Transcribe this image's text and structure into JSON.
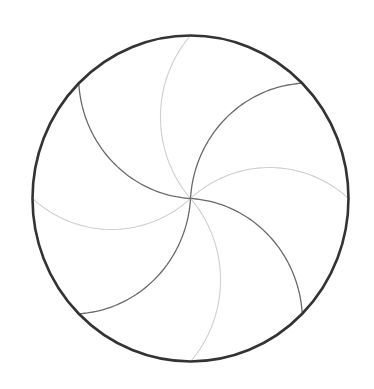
{
  "diagram": {
    "type": "pinwheel-circle",
    "background": "#ffffff",
    "circle": {
      "cx": 190.5,
      "cy": 198.5,
      "rx": 158,
      "ry": 163,
      "stroke": "#333333",
      "stroke_width": 2.6
    },
    "arm_shape": {
      "arc_center_offset": [
        0.563,
        -0.5
      ],
      "note": "Arm defined in unit-circle space for endpoint at angle -90deg; rotated for each arm"
    },
    "arms": [
      {
        "angle": -90,
        "tone": "light"
      },
      {
        "angle": -45,
        "tone": "dark"
      },
      {
        "angle": 0,
        "tone": "light"
      },
      {
        "angle": 45,
        "tone": "dark"
      },
      {
        "angle": 90,
        "tone": "light"
      },
      {
        "angle": 135,
        "tone": "dark"
      },
      {
        "angle": 180,
        "tone": "light"
      },
      {
        "angle": 225,
        "tone": "dark"
      }
    ],
    "colors": {
      "dark": "#6a6a6a",
      "light": "#cfcfcf"
    },
    "stroke_widths": {
      "dark": 1.3,
      "light": 1.1
    }
  }
}
